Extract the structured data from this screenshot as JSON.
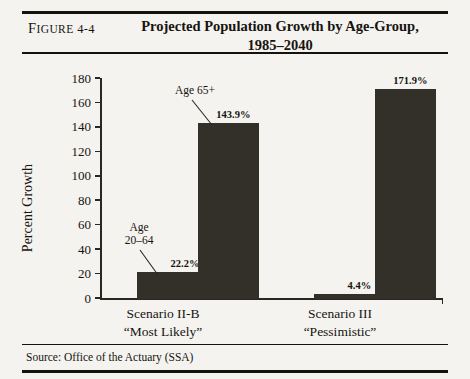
{
  "figure": {
    "label_prefix": "F",
    "label_smallcaps": "IGURE",
    "label_number": " 4-4",
    "title_line1": "Projected Population Growth by Age-Group,",
    "title_line2": "1985–2040",
    "source": "Source: Office of the Actuary (SSA)"
  },
  "chart_data": {
    "type": "bar",
    "title": "Projected Population Growth by Age-Group, 1985–2040",
    "xlabel": "",
    "ylabel": "Percent Growth",
    "ylim": [
      0,
      180
    ],
    "ytick_step": 20,
    "yticks": [
      "180",
      "160",
      "140",
      "120",
      "100",
      "80",
      "60",
      "40",
      "20",
      "0"
    ],
    "grid": false,
    "legend_position": "none",
    "categories": [
      {
        "line1": "Scenario II-B",
        "line2": "“Most Likely”"
      },
      {
        "line1": "Scenario III",
        "line2": "“Pessimistic”"
      }
    ],
    "series": [
      {
        "name": "Age 20–64",
        "values": [
          22.2,
          4.4
        ],
        "labels": [
          "22.2%",
          "4.4%"
        ]
      },
      {
        "name": "Age 65+",
        "values": [
          143.9,
          171.9
        ],
        "labels": [
          "143.9%",
          "171.9%"
        ]
      }
    ],
    "annotations": [
      {
        "name": "age-20-64",
        "line1": "Age",
        "line2": "20–64"
      },
      {
        "name": "age-65-plus",
        "line1": "Age 65+",
        "line2": ""
      }
    ],
    "colors": {
      "bar": "#333029",
      "axis": "#2a2722",
      "background": "#f4f3f0"
    }
  }
}
